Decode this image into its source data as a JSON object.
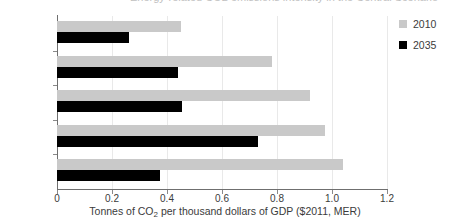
{
  "title_remnant": "Energy-related CO2 emissions intensity in the Central Scenario",
  "chart_data": {
    "type": "bar",
    "orientation": "horizontal",
    "title": "",
    "xlabel": "Tonnes of CO2 per thousand dollars of GDP ($2011, MER)",
    "xlabel_parts": {
      "before": "Tonnes of CO",
      "sub": "2",
      "after": " per thousand dollars of GDP ($2011, MER)"
    },
    "ylabel": "",
    "categories": [
      "World",
      "Middle East",
      "Russia",
      "Iraq",
      "China"
    ],
    "series": [
      {
        "name": "2010",
        "color": "#c9c9c9",
        "values": [
          0.45,
          0.78,
          0.92,
          0.975,
          1.04
        ]
      },
      {
        "name": "2035",
        "color": "#000000",
        "values": [
          0.26,
          0.44,
          0.455,
          0.73,
          0.375
        ]
      }
    ],
    "xlim": [
      0,
      1.2
    ],
    "xticks": [
      0,
      0.2,
      0.4,
      0.6,
      0.8,
      1.0,
      1.2
    ],
    "xtick_labels": [
      "0",
      "0.2",
      "0.4",
      "0.6",
      "0.8",
      "1.0",
      "1.2"
    ],
    "grid": true,
    "grid_axis": "x",
    "legend_position": "right",
    "legend": [
      {
        "label": "2010",
        "color": "#c9c9c9"
      },
      {
        "label": "2035",
        "color": "#000000"
      }
    ]
  }
}
